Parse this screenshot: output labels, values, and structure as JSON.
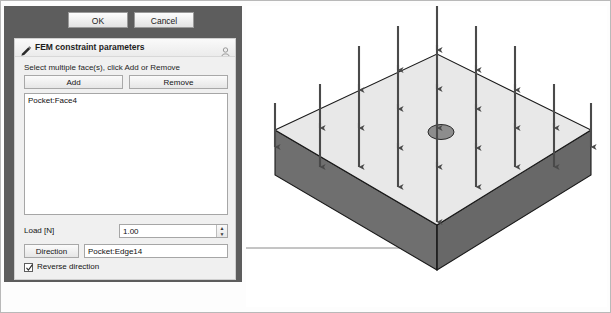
{
  "window": {
    "ok_label": "OK",
    "cancel_label": "Cancel"
  },
  "dialog": {
    "title": "FEM constraint parameters",
    "title_icon": "pencil-icon",
    "corner_icon": "collapse-icon",
    "hint": "Select multiple face(s), click Add or Remove",
    "add_label": "Add",
    "remove_label": "Remove",
    "selection_list": [
      "Pocket:Face4"
    ],
    "load_label": "Load [N]",
    "load_value": "1.00",
    "spin_up": "▲",
    "spin_down": "▼",
    "direction_label": "Direction",
    "direction_value": "Pocket:Edge14",
    "reverse_label": "Reverse direction",
    "reverse_checked": true
  },
  "viewport": {
    "name": "3d-model-view",
    "model": "rectangular-block-with-hole",
    "load_arrow_count": 25,
    "arrow_direction": "down",
    "leader_line": true
  },
  "colors": {
    "panel_bg": "#5d5d5d",
    "dialog_bg": "#f0f0f0",
    "top_face": "#e8e8e8",
    "front_face": "#6f6f6f",
    "side_face": "#6a6a6a",
    "arrow": "#4a4a4a",
    "edge": "#1a1a1a",
    "leader": "#8a8a8a"
  }
}
